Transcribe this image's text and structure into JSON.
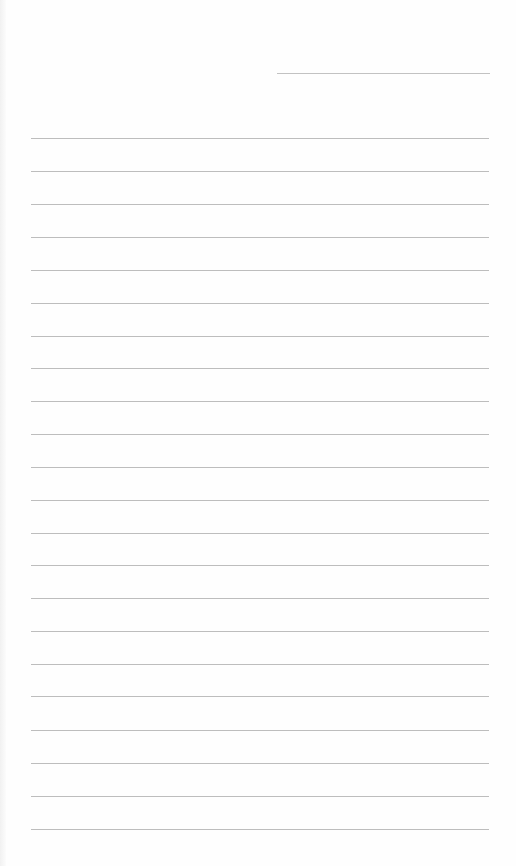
{
  "page": {
    "type": "lined-paper",
    "background_color": "#fefefe",
    "line_color": "#bdbdbd"
  },
  "header_field": {
    "label": "",
    "value": "",
    "left": 277,
    "right": 490,
    "y": 73
  },
  "ruled_lines": {
    "left": 31,
    "right": 489,
    "count": 22,
    "y_positions": [
      138,
      171,
      204,
      237,
      270,
      303,
      336,
      368,
      401,
      434,
      467,
      500,
      533,
      565,
      598,
      631,
      664,
      696,
      730,
      763,
      796,
      829
    ],
    "values": [
      "",
      "",
      "",
      "",
      "",
      "",
      "",
      "",
      "",
      "",
      "",
      "",
      "",
      "",
      "",
      "",
      "",
      "",
      "",
      "",
      "",
      ""
    ]
  }
}
